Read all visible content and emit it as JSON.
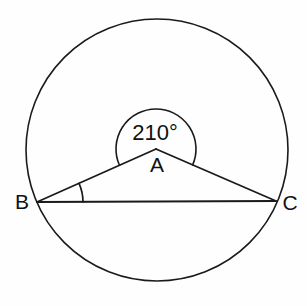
{
  "figure": {
    "kind": "circle-geometry-diagram",
    "background_color": "#fefefe",
    "stroke_color": "#1a1a1a"
  },
  "circle": {
    "name": "circumscribed-circle",
    "center_x": 157,
    "center_y": 150,
    "radius": 131,
    "stroke_width": 1.6
  },
  "points": [
    {
      "id": "A",
      "label": "A",
      "x": 156,
      "y": 149,
      "label_x": 157,
      "label_y": 166,
      "position_note": "apex-inside-circle"
    },
    {
      "id": "B",
      "label": "B",
      "x": 37,
      "y": 202,
      "label_x": 22,
      "label_y": 203,
      "position_note": "on-circle-left"
    },
    {
      "id": "C",
      "label": "C",
      "x": 276,
      "y": 201,
      "label_x": 290,
      "label_y": 204,
      "position_note": "on-circle-right"
    }
  ],
  "segments": [
    {
      "name": "segment-BA",
      "from": "B",
      "to": "A",
      "stroke_width": 1.8
    },
    {
      "name": "segment-AC",
      "from": "A",
      "to": "C",
      "stroke_width": 1.8
    },
    {
      "name": "segment-BC",
      "from": "B",
      "to": "C",
      "stroke_width": 1.8
    }
  ],
  "angles": [
    {
      "name": "reflex-angle-at-A",
      "vertex": "A",
      "value": "210",
      "degree_symbol": "°",
      "label": "210°",
      "label_x": 155,
      "label_y": 134,
      "arc_radius": 40,
      "arc_note": "reflex arc drawn above vertex A, from ray AB around the top to ray AC",
      "stroke_width": 1.6
    },
    {
      "name": "angle-at-B",
      "vertex": "B",
      "value": "",
      "label": "",
      "arc_radius": 46,
      "arc_note": "small arc between chord BC and ray BA",
      "stroke_width": 1.7
    }
  ],
  "labels": {
    "angle_value_text": "210°",
    "vertex_a_text": "A",
    "vertex_b_text": "B",
    "vertex_c_text": "C"
  }
}
